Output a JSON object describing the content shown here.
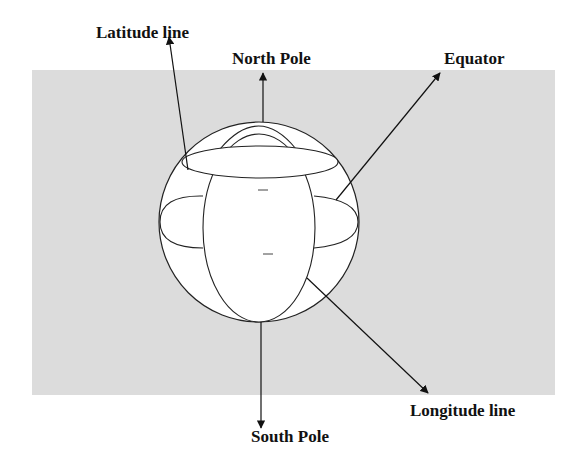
{
  "diagram": {
    "labels": {
      "latitude_line": "Latitude line",
      "north_pole": "North Pole",
      "equator": "Equator",
      "longitude_line": "Longitude line",
      "south_pole": "South Pole"
    },
    "colors": {
      "background_panel": "#dcdcdc",
      "sphere_fill": "#ffffff",
      "stroke": "#222222",
      "text": "#111111"
    }
  }
}
